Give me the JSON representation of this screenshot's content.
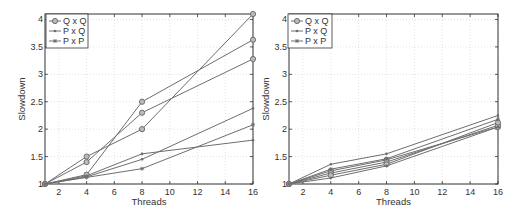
{
  "chart_data": [
    {
      "type": "line",
      "title": "",
      "xlabel": "Threads",
      "ylabel": "Slowdown",
      "xlim": [
        1,
        16
      ],
      "ylim": [
        1,
        4.1
      ],
      "xticks": [
        2,
        4,
        6,
        8,
        10,
        12,
        14,
        16
      ],
      "yticks": [
        1,
        1.5,
        2,
        2.5,
        3,
        3.5,
        4
      ],
      "grid": true,
      "legend_position": "upper left",
      "legend": [
        "Q x Q",
        "P x Q",
        "P x P"
      ],
      "x": [
        1,
        4,
        8,
        16
      ],
      "series": [
        {
          "name": "Q x Q",
          "marker": "circle",
          "values": [
            1,
            1.17,
            2.5,
            3.63
          ]
        },
        {
          "name": "Q x Q",
          "marker": "circle",
          "values": [
            1,
            1.4,
            2.3,
            3.28
          ]
        },
        {
          "name": "Q x Q",
          "marker": "circle",
          "values": [
            1,
            1.5,
            2.0,
            4.1
          ]
        },
        {
          "name": "P x Q",
          "marker": "dot",
          "values": [
            1,
            1.15,
            1.55,
            1.8
          ]
        },
        {
          "name": "P x Q",
          "marker": "dot",
          "values": [
            1,
            1.13,
            1.45,
            2.38
          ]
        },
        {
          "name": "P x P",
          "marker": "star",
          "values": [
            1,
            1.12,
            1.28,
            2.08
          ]
        }
      ]
    },
    {
      "type": "line",
      "title": "",
      "xlabel": "Threads",
      "ylabel": "Slowdown",
      "xlim": [
        1,
        16
      ],
      "ylim": [
        1,
        4.1
      ],
      "xticks": [
        2,
        4,
        6,
        8,
        10,
        12,
        14,
        16
      ],
      "yticks": [
        1,
        1.5,
        2,
        2.5,
        3,
        3.5,
        4
      ],
      "grid": true,
      "legend_position": "upper left",
      "legend": [
        "Q x Q",
        "P x Q",
        "P x P"
      ],
      "x": [
        1,
        4,
        8,
        16
      ],
      "series": [
        {
          "name": "Q x Q",
          "marker": "circle",
          "values": [
            1,
            1.24,
            1.44,
            2.04
          ]
        },
        {
          "name": "Q x Q",
          "marker": "circle",
          "values": [
            1,
            1.2,
            1.4,
            2.07
          ]
        },
        {
          "name": "Q x Q",
          "marker": "circle",
          "values": [
            1,
            1.16,
            1.36,
            2.12
          ]
        },
        {
          "name": "P x Q",
          "marker": "dot",
          "values": [
            1,
            1.36,
            1.55,
            2.25
          ]
        },
        {
          "name": "P x Q",
          "marker": "dot",
          "values": [
            1,
            1.11,
            1.33,
            2.04
          ]
        },
        {
          "name": "P x P",
          "marker": "star",
          "values": [
            1,
            1.27,
            1.46,
            2.18
          ]
        }
      ]
    }
  ],
  "charts": [
    {
      "xlabel": "Threads",
      "ylabel": "Slowdown",
      "legend": [
        {
          "label": "Q x Q"
        },
        {
          "label": "P x Q"
        },
        {
          "label": "P x P"
        }
      ]
    },
    {
      "xlabel": "Threads",
      "ylabel": "Slowdown",
      "legend": [
        {
          "label": "Q x Q"
        },
        {
          "label": "P x Q"
        },
        {
          "label": "P x P"
        }
      ]
    }
  ],
  "colors": {
    "line": "#6e6e6e",
    "axis": "#333333",
    "grid": "#cfcfcf"
  }
}
